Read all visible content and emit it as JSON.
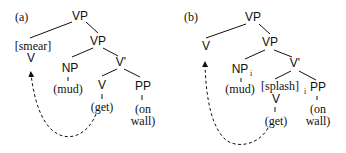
{
  "panels": [
    {
      "label": "(a)",
      "nodes": {
        "root": "VP",
        "left_feature": "[smear]",
        "left_head": "V",
        "vp2": "VP",
        "np": "NP",
        "vbar": "V'",
        "np_word": "(mud)",
        "v": "V",
        "pp": "PP",
        "v_word": "(get)",
        "pp_word_1": "(on",
        "pp_word_2": "wall)"
      },
      "arrow": "dashed curved arrow from (get) to higher V"
    },
    {
      "label": "(b)",
      "nodes": {
        "root": "VP",
        "left_head": "V",
        "vp2": "VP",
        "np": "NP",
        "np_index": "i",
        "vbar": "V'",
        "np_word": "(mud)",
        "v_feature": "[splash]",
        "v_feature_index": "i",
        "v": "V",
        "pp": "PP",
        "v_word": "(get)",
        "pp_word_1": "(on",
        "pp_word_2": "wall)"
      },
      "arrow": "dashed curved arrow from (get) to higher V"
    }
  ]
}
